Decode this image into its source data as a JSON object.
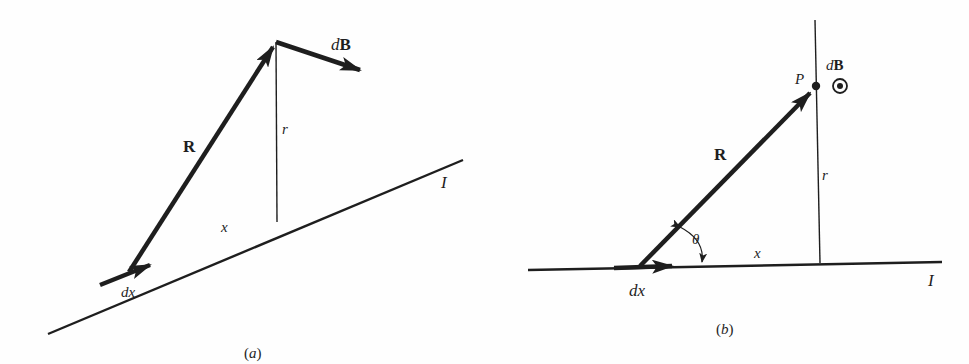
{
  "figure": {
    "panels": [
      {
        "id": "a",
        "caption": "(a)",
        "labels": {
          "R": "R",
          "r": "r",
          "dB": "dB",
          "dB_d": "d",
          "dB_B": "B",
          "x": "x",
          "dx": "dx",
          "I": "I"
        },
        "description": "Current element dx on a straight wire carrying current I; vector R from dx to field point; perpendicular distance r; field contribution dB"
      },
      {
        "id": "b",
        "caption": "(b)",
        "labels": {
          "P": "P",
          "R": "R",
          "r": "r",
          "dB_d": "d",
          "dB_B": "B",
          "theta": "θ",
          "x": "x",
          "dx": "dx",
          "I": "I"
        },
        "description": "Field point P at perpendicular distance r from wire; angle θ between R and wire; dB directed out of page (circled dot)"
      }
    ],
    "colors": {
      "ink": "#1e1e1e",
      "background": "#fefefe"
    }
  }
}
